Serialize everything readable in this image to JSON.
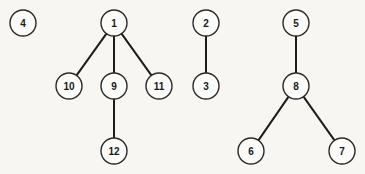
{
  "diagram": {
    "type": "forest",
    "node_radius": 13,
    "nodes": [
      {
        "id": "4",
        "label": "4",
        "x": 23,
        "y": 23
      },
      {
        "id": "1",
        "label": "1",
        "x": 114,
        "y": 23
      },
      {
        "id": "10",
        "label": "10",
        "x": 69,
        "y": 86
      },
      {
        "id": "9",
        "label": "9",
        "x": 114,
        "y": 86
      },
      {
        "id": "11",
        "label": "11",
        "x": 159,
        "y": 86
      },
      {
        "id": "12",
        "label": "12",
        "x": 114,
        "y": 151
      },
      {
        "id": "2",
        "label": "2",
        "x": 206,
        "y": 23
      },
      {
        "id": "3",
        "label": "3",
        "x": 206,
        "y": 86
      },
      {
        "id": "5",
        "label": "5",
        "x": 296,
        "y": 23
      },
      {
        "id": "8",
        "label": "8",
        "x": 296,
        "y": 86
      },
      {
        "id": "6",
        "label": "6",
        "x": 251,
        "y": 151
      },
      {
        "id": "7",
        "label": "7",
        "x": 342,
        "y": 151
      }
    ],
    "edges": [
      {
        "from": "1",
        "to": "10"
      },
      {
        "from": "1",
        "to": "9"
      },
      {
        "from": "1",
        "to": "11"
      },
      {
        "from": "9",
        "to": "12"
      },
      {
        "from": "2",
        "to": "3"
      },
      {
        "from": "5",
        "to": "8"
      },
      {
        "from": "8",
        "to": "6"
      },
      {
        "from": "8",
        "to": "7"
      }
    ],
    "trees": [
      {
        "root": "4",
        "members": [
          "4"
        ]
      },
      {
        "root": "1",
        "members": [
          "1",
          "10",
          "9",
          "11",
          "12"
        ]
      },
      {
        "root": "2",
        "members": [
          "2",
          "3"
        ]
      },
      {
        "root": "5",
        "members": [
          "5",
          "8",
          "6",
          "7"
        ]
      }
    ]
  }
}
